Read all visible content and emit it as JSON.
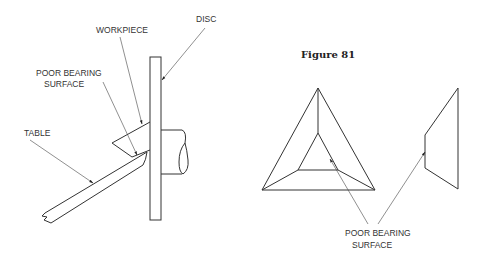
{
  "figure": {
    "title": "Figure 81"
  },
  "left_diagram": {
    "labels": {
      "disc": "DISC",
      "workpiece": "WORKPIECE",
      "poor_bearing_line1": "POOR BEARING",
      "poor_bearing_line2": "SURFACE",
      "table": "TABLE"
    }
  },
  "right_diagram": {
    "labels": {
      "poor_bearing_line1": "POOR BEARING",
      "poor_bearing_line2": "SURFACE"
    }
  },
  "colors": {
    "line": "#333333",
    "background": "#ffffff"
  }
}
